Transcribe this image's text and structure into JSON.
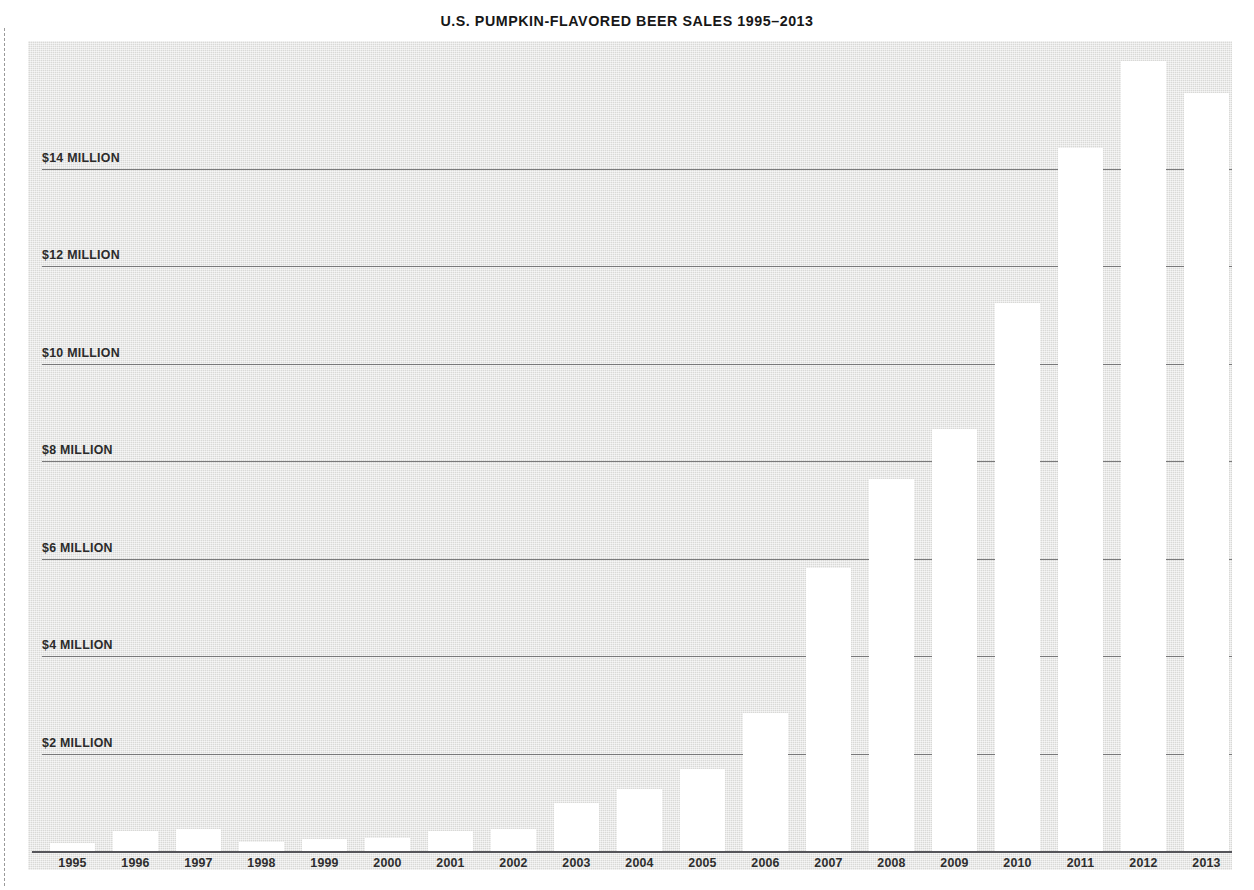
{
  "chart_data": {
    "type": "bar",
    "title": "U.S. PUMPKIN-FLAVORED BEER SALES 1995–2013",
    "xlabel": "",
    "ylabel": "",
    "categories": [
      "1995",
      "1996",
      "1997",
      "1998",
      "1999",
      "2000",
      "2001",
      "2002",
      "2003",
      "2004",
      "2005",
      "2006",
      "2007",
      "2008",
      "2009",
      "2010",
      "2011",
      "2012",
      "2013"
    ],
    "values": [
      0.16,
      0.41,
      0.45,
      0.18,
      0.25,
      0.27,
      0.41,
      0.45,
      0.98,
      1.27,
      1.68,
      2.83,
      5.8,
      7.63,
      8.66,
      11.24,
      14.42,
      16.2,
      15.54
    ],
    "value_unit": "millions of U.S. dollars",
    "ylim": [
      0,
      16.6
    ],
    "yticks": [
      2,
      4,
      6,
      8,
      10,
      12,
      14
    ],
    "ytick_labels": [
      "$2 MILLION",
      "$4 MILLION",
      "$6 MILLION",
      "$8 MILLION",
      "$10 MILLION",
      "$12 MILLION",
      "$14 MILLION"
    ],
    "grid": true,
    "legend": false,
    "bar_color": "#ffffff",
    "plot_background_color": "#dededc",
    "gridline_color": "#6f6f70",
    "axis_color": "#55555a",
    "text_color": "#2b2b2b"
  },
  "page": {
    "background_color": "#ffffff",
    "cut_line": "dashed-page-cut-line"
  }
}
